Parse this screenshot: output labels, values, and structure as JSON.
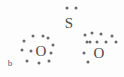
{
  "diagram": {
    "part_label": "b",
    "part_label_pos": {
      "x": 10,
      "y": 63
    },
    "dot_color": "#6b6b6b",
    "text_color": "#4a4a4a",
    "background": "#fdfdfd",
    "atoms": [
      {
        "symbol": "S",
        "name": "sulfur-atom",
        "x": 69,
        "y": 23
      },
      {
        "symbol": "O",
        "name": "oxygen-atom-left",
        "x": 41,
        "y": 51
      },
      {
        "symbol": "O",
        "name": "oxygen-atom-right",
        "x": 99,
        "y": 53
      }
    ],
    "electron_dots": [
      {
        "name": "lone-pair-dot-s-top-left",
        "x": 67,
        "y": 8
      },
      {
        "name": "lone-pair-dot-s-top-right",
        "x": 76,
        "y": 8
      },
      {
        "name": "bond-dot-s-o-left-upper",
        "x": 48,
        "y": 38
      },
      {
        "name": "bond-dot-s-o-left-lower",
        "x": 53,
        "y": 45
      },
      {
        "name": "bond-dot-s-o-right-upper",
        "x": 85,
        "y": 35
      },
      {
        "name": "bond-dot-s-o-right-lower",
        "x": 90,
        "y": 42
      },
      {
        "name": "lone-pair-dot-o-left-1",
        "x": 24,
        "y": 41
      },
      {
        "name": "lone-pair-dot-o-left-2",
        "x": 33,
        "y": 36
      },
      {
        "name": "lone-pair-dot-o-left-3",
        "x": 43,
        "y": 36
      },
      {
        "name": "lone-pair-dot-o-left-4",
        "x": 22,
        "y": 50
      },
      {
        "name": "lone-pair-dot-o-left-5",
        "x": 31,
        "y": 51
      },
      {
        "name": "lone-pair-dot-o-left-6",
        "x": 51,
        "y": 53
      },
      {
        "name": "lone-pair-dot-o-left-7",
        "x": 27,
        "y": 61
      },
      {
        "name": "lone-pair-dot-o-left-8",
        "x": 39,
        "y": 63
      },
      {
        "name": "lone-pair-dot-o-left-9",
        "x": 49,
        "y": 61
      },
      {
        "name": "lone-pair-dot-o-right-1",
        "x": 92,
        "y": 33
      },
      {
        "name": "lone-pair-dot-o-right-2",
        "x": 101,
        "y": 34
      },
      {
        "name": "lone-pair-dot-o-right-3",
        "x": 112,
        "y": 36
      },
      {
        "name": "lone-pair-dot-o-right-4",
        "x": 87,
        "y": 42
      },
      {
        "name": "lone-pair-dot-o-right-5",
        "x": 97,
        "y": 42
      },
      {
        "name": "lone-pair-dot-o-right-6",
        "x": 106,
        "y": 42
      },
      {
        "name": "lone-pair-dot-o-right-7",
        "x": 116,
        "y": 42
      },
      {
        "name": "lone-pair-dot-o-right-8",
        "x": 84,
        "y": 53
      },
      {
        "name": "lone-pair-dot-o-right-9",
        "x": 88,
        "y": 62
      }
    ]
  }
}
